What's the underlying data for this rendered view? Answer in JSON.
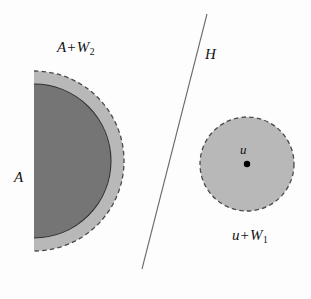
{
  "figure": {
    "background_color": "#fdfdfd",
    "width": 311,
    "height": 299
  },
  "colors": {
    "dark_gray_fill": "#757575",
    "light_gray_fill": "#b8b8b8",
    "outline": "#3a3a3a",
    "line": "#6b6b6b",
    "point": "#000000",
    "text": "#121212"
  },
  "shapes": {
    "set_a": {
      "name": "A",
      "kind": "half-disk",
      "fill": "#757575",
      "border_style": "solid",
      "center_x": 34,
      "center_y": 161,
      "radius": 77,
      "flat_edge_x": 34
    },
    "set_a_plus_w2": {
      "name": "A + W2",
      "kind": "half-disk",
      "fill": "#b8b8b8",
      "border_style": "dashed",
      "center_x": 34,
      "center_y": 161,
      "radius": 90,
      "flat_edge_x": 34
    },
    "set_u_plus_w1": {
      "name": "u + W1",
      "kind": "disk",
      "fill": "#b8b8b8",
      "border_style": "dashed",
      "center_x": 247,
      "center_y": 164,
      "radius": 47
    },
    "point_u": {
      "name": "u",
      "kind": "point",
      "x": 247,
      "y": 164,
      "radius": 3.2
    },
    "hyperplane_h": {
      "name": "H",
      "kind": "line",
      "x1": 207,
      "y1": 14,
      "x2": 142,
      "y2": 269,
      "stroke_width": 1
    }
  },
  "labels": {
    "a_plus_w2": {
      "main": "A",
      "operator": "+",
      "second": "W",
      "subscript": "2"
    },
    "a": {
      "main": "A"
    },
    "h": {
      "main": "H"
    },
    "u": {
      "main": "u"
    },
    "u_plus_w1": {
      "main": "u",
      "operator": "+",
      "second": "W",
      "subscript": "1"
    }
  }
}
